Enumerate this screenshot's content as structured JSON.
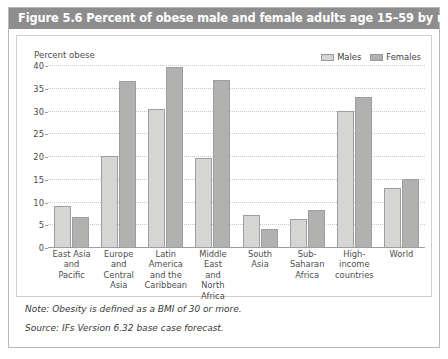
{
  "figure": {
    "title": "Figure 5.6 Percent of obese male and female adults age 15–59 by region (2060)",
    "note": "Note: Obesity is defined as a BMI of 30 or more.",
    "source": "Source: IFs Version 6.32 base case forecast."
  },
  "colors": {
    "title_bar": "#8d8d8d",
    "males": "#d5d5d3",
    "females": "#b1b1af",
    "bar_border": "#9e9e9e",
    "grid": "#c9c9c9",
    "axis": "#9d9d9d"
  },
  "legend": {
    "males_label": "Males",
    "females_label": "Females"
  },
  "chart_data": {
    "type": "bar",
    "title": "Figure 5.6 Percent of obese male and female adults age 15–59 by region (2060)",
    "xlabel": "",
    "ylabel": "Percent obese",
    "ylim": [
      0,
      40
    ],
    "ytick_step": 5,
    "yticks": [
      0,
      5,
      10,
      15,
      20,
      25,
      30,
      35,
      40
    ],
    "ytick_labels": [
      "0",
      "5",
      "10",
      "15",
      "20",
      "25",
      "30",
      "35",
      "40"
    ],
    "grid": true,
    "legend_position": "top-right",
    "categories": [
      "East Asia and Pacific",
      "Europe and Central Asia",
      "Latin America and the Caribbean",
      "Middle East and North Africa",
      "South Asia",
      "Sub-Saharan Africa",
      "High-income countries",
      "World"
    ],
    "category_lines": [
      [
        "East Asia",
        "and",
        "Pacific"
      ],
      [
        "Europe",
        "and",
        "Central",
        "Asia"
      ],
      [
        "Latin",
        "America",
        "and the",
        "Caribbean"
      ],
      [
        "Middle East",
        "and",
        "North Africa"
      ],
      [
        "South",
        "Asia"
      ],
      [
        "Sub-",
        "Saharan",
        "Africa"
      ],
      [
        "High-",
        "income",
        "countries"
      ],
      [
        "World"
      ]
    ],
    "series": [
      {
        "name": "Males",
        "color": "#d5d5d3",
        "values": [
          9.0,
          20.1,
          30.3,
          19.6,
          7.1,
          6.2,
          30.0,
          13.0
        ]
      },
      {
        "name": "Females",
        "color": "#b1b1af",
        "values": [
          6.5,
          36.5,
          39.6,
          36.8,
          4.0,
          8.1,
          33.0,
          15.0
        ]
      }
    ]
  }
}
